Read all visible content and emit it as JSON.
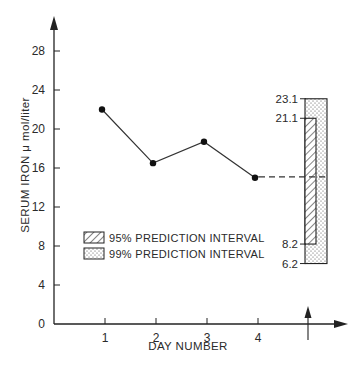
{
  "chart_data": {
    "type": "line",
    "title": "",
    "xlabel": "DAY NUMBER",
    "ylabel": "SERUM IRON  μ mol/liter",
    "x": [
      1,
      2,
      3,
      4
    ],
    "x_tick_labels": [
      "1",
      "2",
      "3",
      "4"
    ],
    "y_ticks": [
      0,
      4,
      8,
      12,
      16,
      20,
      24,
      28
    ],
    "ylim": [
      0,
      30
    ],
    "grid": false,
    "series": [
      {
        "name": "Serum iron",
        "values": [
          22.0,
          16.5,
          18.7,
          15.0
        ]
      }
    ],
    "projection": {
      "from_day": 4,
      "value": 15.1,
      "style": "dashed",
      "marker": "arrow on x-axis"
    },
    "intervals": [
      {
        "name": "95% PREDICTION INTERVAL",
        "low": 8.2,
        "high": 21.1,
        "pattern": "diagonal-hatch"
      },
      {
        "name": "99% PREDICTION INTERVAL",
        "low": 6.2,
        "high": 23.1,
        "pattern": "stipple"
      }
    ],
    "legend_position": "lower-left inside plot"
  },
  "labels": {
    "interval_95_high": "21.1",
    "interval_95_low": "8.2",
    "interval_99_high": "23.1",
    "interval_99_low": "6.2",
    "legend_95": "95% PREDICTION INTERVAL",
    "legend_99": "99% PREDICTION INTERVAL"
  }
}
